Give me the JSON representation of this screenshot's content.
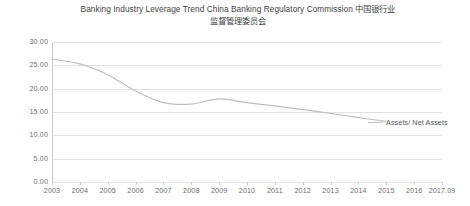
{
  "chart_data": {
    "type": "line",
    "title_line_1": "Banking Industry Leverage Trend China Banking Regulatory Commission 中国银行业",
    "title_line_2": "监督管理委员会",
    "xlabel": "",
    "ylabel": "",
    "categories": [
      "2003",
      "2004",
      "2005",
      "2006",
      "2007",
      "2008",
      "2009",
      "2010",
      "2011",
      "2012",
      "2013",
      "2014",
      "2015",
      "2016",
      "2017.09"
    ],
    "series": [
      {
        "name": "Assets/ Net Assets",
        "values": [
          26.3,
          25.3,
          23.0,
          19.5,
          17.0,
          16.7,
          17.8,
          17.0,
          16.3,
          15.5,
          14.7,
          13.8,
          13.0,
          null,
          null
        ],
        "color": "#bfbfbf",
        "smooth": true
      }
    ],
    "ylim": [
      0.0,
      30.0
    ],
    "yticks": [
      0.0,
      5.0,
      10.0,
      15.0,
      20.0,
      25.0,
      30.0
    ],
    "ytick_labels": [
      "0.00",
      "5.00",
      "10.00",
      "15.00",
      "20.00",
      "25.00",
      "30.00"
    ],
    "grid": true,
    "grid_axis": "y",
    "legend": "inline-right",
    "annotations": [
      {
        "text": "Assets/ Net Assets",
        "anchor": "right-of-line-end"
      }
    ]
  },
  "colors": {
    "line": "#bfbfbf",
    "grid": "#e2e2e2",
    "axis": "#c8c8c8",
    "text": "#6e6e6e",
    "title": "#3f3f3f",
    "background": "#ffffff"
  }
}
